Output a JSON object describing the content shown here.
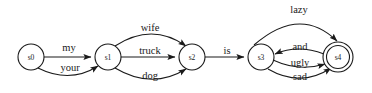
{
  "diagram": {
    "background_color": "#ffffff",
    "stroke_color": "#1a1a1a",
    "states": [
      {
        "id": "s0",
        "label": "s0",
        "cx": 31,
        "cy": 57,
        "r": 13,
        "accepting": false
      },
      {
        "id": "s1",
        "label": "s1",
        "cx": 108,
        "cy": 57,
        "r": 13,
        "accepting": false
      },
      {
        "id": "s2",
        "label": "s2",
        "cx": 192,
        "cy": 57,
        "r": 13,
        "accepting": false
      },
      {
        "id": "s3",
        "label": "s3",
        "cx": 261,
        "cy": 57,
        "r": 13,
        "accepting": false
      },
      {
        "id": "s4",
        "label": "s4",
        "cx": 338,
        "cy": 57,
        "r": 15,
        "inner_r": 11.5,
        "accepting": true
      }
    ],
    "transitions": [
      {
        "id": "t-my",
        "label": "my",
        "from": "s0",
        "to": "s1",
        "shape": "straight",
        "label_x": 69,
        "label_y": 51
      },
      {
        "id": "t-your",
        "label": "your",
        "from": "s0",
        "to": "s1",
        "shape": "curve-down",
        "label_x": 70,
        "label_y": 68
      },
      {
        "id": "t-wife",
        "label": "wife",
        "from": "s1",
        "to": "s2",
        "shape": "curve-up",
        "label_x": 150,
        "label_y": 35
      },
      {
        "id": "t-truck",
        "label": "truck",
        "from": "s1",
        "to": "s2",
        "shape": "straight",
        "label_x": 150,
        "label_y": 55
      },
      {
        "id": "t-dog",
        "label": "dog",
        "from": "s1",
        "to": "s2",
        "shape": "curve-down",
        "label_x": 150,
        "label_y": 77
      },
      {
        "id": "t-is",
        "label": "is",
        "from": "s2",
        "to": "s3",
        "shape": "straight",
        "label_x": 227,
        "label_y": 54
      },
      {
        "id": "t-lazy",
        "label": "lazy",
        "from": "s3",
        "to": "s4",
        "shape": "arc-over-top",
        "label_x": 299,
        "label_y": 13
      },
      {
        "id": "t-and",
        "label": "and",
        "from": "s4",
        "to": "s3",
        "shape": "curve-reverse",
        "label_x": 300,
        "label_y": 50
      },
      {
        "id": "t-ugly",
        "label": "ugly",
        "from": "s3",
        "to": "s4",
        "shape": "curve-slight",
        "label_x": 300,
        "label_y": 66
      },
      {
        "id": "t-sad",
        "label": "sad",
        "from": "s3",
        "to": "s4",
        "shape": "curve-down",
        "label_x": 300,
        "label_y": 80
      }
    ]
  }
}
